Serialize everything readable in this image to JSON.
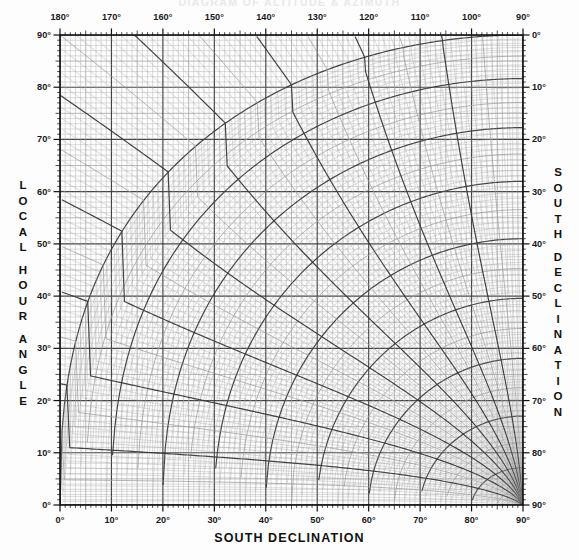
{
  "title": "DIAGRAM OF ALTITUDE & AZIMUTH",
  "axes": {
    "top": {
      "name": "LOCAL HOUR ANGLE",
      "unit": "°",
      "ticks": [
        180,
        170,
        160,
        150,
        140,
        130,
        120,
        110,
        100,
        90
      ],
      "tick_labels": [
        "180°",
        "170°",
        "160°",
        "150°",
        "140°",
        "130°",
        "120°",
        "110°",
        "100°",
        "90°"
      ],
      "range": [
        180,
        90
      ],
      "minor_step": 1,
      "major_step": 10
    },
    "left": {
      "name": "LOCAL HOUR ANGLE",
      "letters": [
        "L",
        "O",
        "C",
        "A",
        "L",
        "",
        "H",
        "O",
        "U",
        "R",
        "",
        "A",
        "N",
        "G",
        "L",
        "E"
      ],
      "unit": "°",
      "ticks": [
        90,
        80,
        70,
        60,
        50,
        40,
        30,
        20,
        10,
        0
      ],
      "tick_labels": [
        "90°",
        "80°",
        "70°",
        "60°",
        "50°",
        "40°",
        "30°",
        "20°",
        "10°",
        "0°"
      ],
      "range": [
        90,
        0
      ],
      "minor_step": 1,
      "major_step": 10
    },
    "right": {
      "name": "SOUTH DECLINATION",
      "letters": [
        "S",
        "O",
        "U",
        "T",
        "H",
        "",
        "D",
        "E",
        "C",
        "L",
        "I",
        "N",
        "A",
        "T",
        "I",
        "O",
        "N"
      ],
      "unit": "°",
      "ticks": [
        0,
        10,
        20,
        30,
        40,
        50,
        60,
        70,
        80,
        90
      ],
      "tick_labels": [
        "0°",
        "10°",
        "20°",
        "30°",
        "40°",
        "50°",
        "60°",
        "70°",
        "80°",
        "90°"
      ],
      "range": [
        0,
        90
      ],
      "minor_step": 1,
      "major_step": 10
    },
    "bottom": {
      "name": "SOUTH DECLINATION",
      "unit": "°",
      "ticks": [
        0,
        10,
        20,
        30,
        40,
        50,
        60,
        70,
        80,
        90
      ],
      "tick_labels": [
        "0°",
        "10°",
        "20°",
        "30°",
        "40°",
        "50°",
        "60°",
        "70°",
        "80°",
        "90°"
      ],
      "range": [
        0,
        90
      ],
      "minor_step": 1,
      "major_step": 10
    }
  },
  "corners": {
    "top_left_inner": "90°",
    "top_left_outer": "180°",
    "top_right_inner": "0°",
    "top_right_outer": "90°",
    "bottom_left": "0°",
    "bottom_right": "90°"
  },
  "chart_data": {
    "type": "line",
    "title": "DIAGRAM OF ALTITUDE & AZIMUTH",
    "xlabel": "SOUTH DECLINATION",
    "ylabel": "LOCAL HOUR ANGLE",
    "xlim": [
      0,
      90
    ],
    "ylim": [
      0,
      90
    ],
    "grid": true,
    "legend": "none",
    "families": [
      {
        "name": "altitude-curves",
        "values": [
          0,
          5,
          10,
          15,
          20,
          25,
          30,
          35,
          40,
          45,
          50,
          55,
          60,
          65,
          70,
          75,
          80,
          85,
          90
        ],
        "emphasis_step": 5,
        "minor_step": 1
      },
      {
        "name": "azimuth-curves",
        "values": [
          0,
          5,
          10,
          15,
          20,
          25,
          30,
          35,
          40,
          45,
          50,
          55,
          60,
          65,
          70,
          75,
          80,
          85,
          90
        ],
        "emphasis_step": 5,
        "minor_step": 1
      }
    ],
    "convergence_point": {
      "x": 90,
      "y": 0
    },
    "plot_box_px": {
      "left": 60,
      "top": 35,
      "right": 523,
      "bottom": 505
    }
  },
  "colors": {
    "background": "#fdfdfd",
    "grid_minor": "#9a9a9a",
    "grid_major": "#3a3a3a",
    "frame": "#101010",
    "text": "#1a1a1a",
    "title_faded": "#e9e9e9"
  }
}
